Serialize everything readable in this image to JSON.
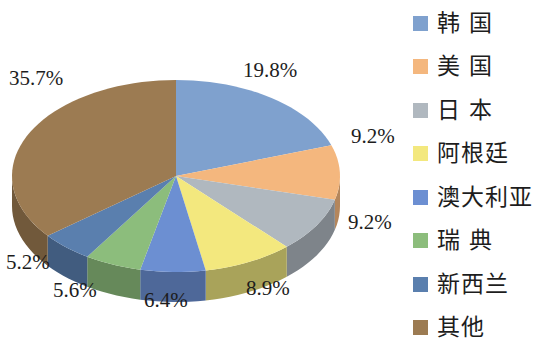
{
  "chart_data": {
    "type": "pie",
    "title": "",
    "subtitle": "",
    "xlabel": "",
    "ylabel": "",
    "three_d": true,
    "legend_position": "right",
    "grid": false,
    "start_angle_deg": 0,
    "direction": "clockwise",
    "categories": [
      "韩 国",
      "美 国",
      "日 本",
      "阿根廷",
      "澳大利亚",
      "瑞 典",
      "新西兰",
      "其他"
    ],
    "values": [
      19.8,
      9.2,
      9.2,
      8.9,
      6.4,
      5.6,
      5.2,
      35.7
    ],
    "labels": [
      "19.8%",
      "9.2%",
      "9.2%",
      "8.9%",
      "6.4%",
      "5.6%",
      "5.2%",
      "35.7%"
    ],
    "colors": [
      "#7FA1CE",
      "#F4B77E",
      "#B0B8BF",
      "#F3E87E",
      "#6C8FD2",
      "#8CBD7C",
      "#5A7FAE",
      "#9C7B52"
    ],
    "side_colors": [
      "#5A7497",
      "#B4865C",
      "#7E848A",
      "#A9A35A",
      "#4E6899",
      "#66895A",
      "#415C7F",
      "#71593B"
    ],
    "slices": [
      {
        "name": "韩 国",
        "value": 19.8,
        "label": "19.8%",
        "color": "#7FA1CE"
      },
      {
        "name": "美 国",
        "value": 9.2,
        "label": "9.2%",
        "color": "#F4B77E"
      },
      {
        "name": "日 本",
        "value": 9.2,
        "label": "9.2%",
        "color": "#B0B8BF"
      },
      {
        "name": "阿根廷",
        "value": 8.9,
        "label": "8.9%",
        "color": "#F3E87E"
      },
      {
        "name": "澳大利亚",
        "value": 6.4,
        "label": "6.4%",
        "color": "#6C8FD2"
      },
      {
        "name": "瑞 典",
        "value": 5.6,
        "label": "5.6%",
        "color": "#8CBD7C"
      },
      {
        "name": "新西兰",
        "value": 5.2,
        "label": "5.2%",
        "color": "#5A7FAE"
      },
      {
        "name": "其他",
        "value": 35.7,
        "label": "35.7%",
        "color": "#9C7B52"
      }
    ]
  },
  "pie": {
    "label_top": "19.8%",
    "label_right_upper": "9.2%",
    "label_right_lower": "9.2%",
    "label_bottom_right": "8.9%",
    "label_bottom_center": "6.4%",
    "label_bottom_left2": "5.6%",
    "label_bottom_left1": "5.2%",
    "label_left_top": "35.7%"
  },
  "legend": {
    "items": [
      {
        "label": "韩 国",
        "color": "#7FA1CE"
      },
      {
        "label": "美 国",
        "color": "#F4B77E"
      },
      {
        "label": "日 本",
        "color": "#B0B8BF"
      },
      {
        "label": "阿根廷",
        "color": "#F3E87E"
      },
      {
        "label": "澳大利亚",
        "color": "#6C8FD2"
      },
      {
        "label": "瑞 典",
        "color": "#8CBD7C"
      },
      {
        "label": "新西兰",
        "color": "#5A7FAE"
      },
      {
        "label": "其他",
        "color": "#9C7B52"
      }
    ]
  }
}
